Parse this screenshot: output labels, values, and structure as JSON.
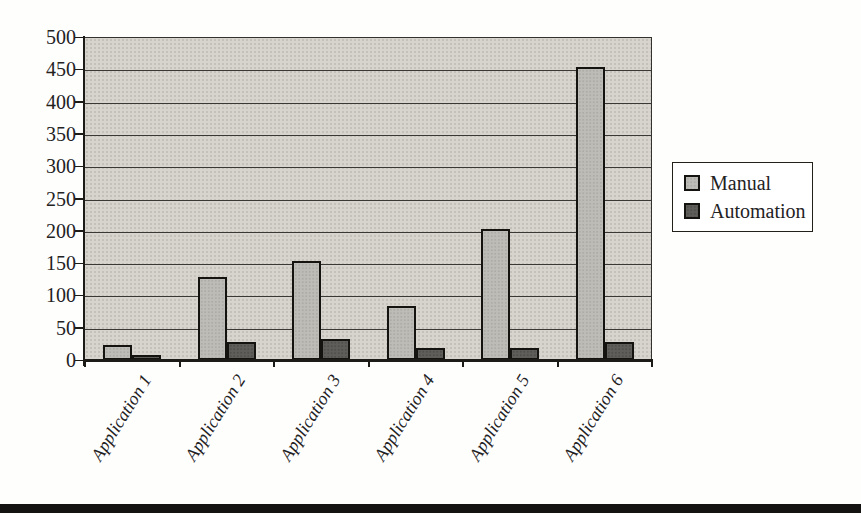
{
  "chart_data": {
    "type": "bar",
    "title": "",
    "xlabel": "",
    "ylabel": "",
    "categories": [
      "Application 1",
      "Application 2",
      "Application 3",
      "Application 4",
      "Application 5",
      "Application 6"
    ],
    "series": [
      {
        "name": "Manual",
        "color": "#bdbcb7",
        "dot_color": "#acaba5",
        "values": [
          20,
          125,
          150,
          80,
          200,
          450
        ]
      },
      {
        "name": "Automation",
        "color": "#5f5e5a",
        "dot_color": "#504f4b",
        "values": [
          3,
          25,
          30,
          15,
          15,
          25
        ]
      }
    ],
    "ylim": [
      0,
      500
    ],
    "ytick_step": 50,
    "yticks": [
      0,
      50,
      100,
      150,
      200,
      250,
      300,
      350,
      400,
      450,
      500
    ],
    "grid": true,
    "legend_position": "right-middle",
    "plot_bg_color": "#d6d4cc",
    "gridline_color": "#3a3935",
    "axis_color": "#1c1b18",
    "text_color": "#23221f",
    "bar_border_color": "#14130f"
  },
  "legend": {
    "items": [
      {
        "label": "Manual"
      },
      {
        "label": "Automation"
      }
    ]
  },
  "page": {
    "bottom_rule_color": "#141312"
  }
}
